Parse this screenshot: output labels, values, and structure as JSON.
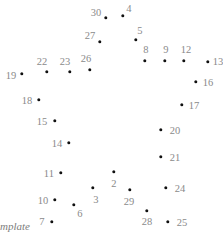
{
  "puzzle": {
    "background_color": "#ffffff",
    "dot_color": "#111111",
    "label_color": "#8a8a8a",
    "watermark_text": "mplate",
    "watermark_x": 0,
    "watermark_y": 221,
    "points": [
      {
        "label": "2",
        "x": 114,
        "y": 172,
        "lx": 114,
        "ly": 184
      },
      {
        "label": "3",
        "x": 93,
        "y": 188,
        "lx": 96,
        "ly": 200
      },
      {
        "label": "4",
        "x": 123,
        "y": 16,
        "lx": 129,
        "ly": 9
      },
      {
        "label": "5",
        "x": 136,
        "y": 40,
        "lx": 140,
        "ly": 31
      },
      {
        "label": "6",
        "x": 74,
        "y": 205,
        "lx": 80,
        "ly": 214
      },
      {
        "label": "7",
        "x": 52,
        "y": 222,
        "lx": 42,
        "ly": 222
      },
      {
        "label": "8",
        "x": 145,
        "y": 61,
        "lx": 146,
        "ly": 50
      },
      {
        "label": "9",
        "x": 165,
        "y": 61,
        "lx": 166,
        "ly": 50
      },
      {
        "label": "10",
        "x": 55,
        "y": 200,
        "lx": 43,
        "ly": 201
      },
      {
        "label": "11",
        "x": 61,
        "y": 173,
        "lx": 49,
        "ly": 174
      },
      {
        "label": "12",
        "x": 184,
        "y": 61,
        "lx": 186,
        "ly": 50
      },
      {
        "label": "13",
        "x": 208,
        "y": 62,
        "lx": 218,
        "ly": 62
      },
      {
        "label": "14",
        "x": 69,
        "y": 143,
        "lx": 57,
        "ly": 144
      },
      {
        "label": "15",
        "x": 55,
        "y": 121,
        "lx": 42,
        "ly": 122
      },
      {
        "label": "16",
        "x": 196,
        "y": 82,
        "lx": 208,
        "ly": 83
      },
      {
        "label": "17",
        "x": 182,
        "y": 105,
        "lx": 194,
        "ly": 106
      },
      {
        "label": "18",
        "x": 39,
        "y": 100,
        "lx": 27,
        "ly": 101
      },
      {
        "label": "19",
        "x": 22,
        "y": 74,
        "lx": 11,
        "ly": 76
      },
      {
        "label": "20",
        "x": 161,
        "y": 130,
        "lx": 175,
        "ly": 131
      },
      {
        "label": "21",
        "x": 161,
        "y": 157,
        "lx": 175,
        "ly": 158
      },
      {
        "label": "22",
        "x": 47,
        "y": 72,
        "lx": 42,
        "ly": 62
      },
      {
        "label": "23",
        "x": 70,
        "y": 72,
        "lx": 65,
        "ly": 62
      },
      {
        "label": "24",
        "x": 166,
        "y": 188,
        "lx": 180,
        "ly": 189
      },
      {
        "label": "25",
        "x": 168,
        "y": 222,
        "lx": 182,
        "ly": 223
      },
      {
        "label": "26",
        "x": 90,
        "y": 70,
        "lx": 86,
        "ly": 59
      },
      {
        "label": "27",
        "x": 100,
        "y": 42,
        "lx": 90,
        "ly": 36
      },
      {
        "label": "28",
        "x": 147,
        "y": 211,
        "lx": 147,
        "ly": 222
      },
      {
        "label": "29",
        "x": 130,
        "y": 190,
        "lx": 129,
        "ly": 202
      },
      {
        "label": "30",
        "x": 106,
        "y": 18,
        "lx": 96,
        "ly": 13
      }
    ]
  }
}
